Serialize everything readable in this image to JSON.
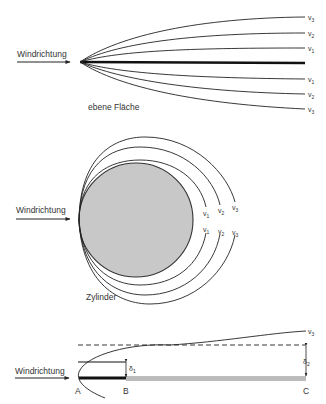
{
  "colors": {
    "line": "#222222",
    "plate": "#111111",
    "cylinder_fill": "#c8c8c8",
    "cylinder_stroke": "#333333",
    "text": "#333333",
    "plate_gray": "#999999"
  },
  "panel1": {
    "title": "ebene Fläche",
    "wind_label": "Windrichtung",
    "velocity_labels_upper": [
      {
        "base": "v",
        "sub": "3"
      },
      {
        "base": "v",
        "sub": "2"
      },
      {
        "base": "v",
        "sub": "1"
      }
    ],
    "velocity_labels_lower": [
      {
        "base": "v",
        "sub": "1"
      },
      {
        "base": "v",
        "sub": "2"
      },
      {
        "base": "v",
        "sub": "3"
      }
    ]
  },
  "panel2": {
    "title": "Zylinder",
    "wind_label": "Windrichtung",
    "velocity_labels_upper": [
      {
        "base": "v",
        "sub": "1"
      },
      {
        "base": "v",
        "sub": "2"
      },
      {
        "base": "v",
        "sub": "3"
      }
    ],
    "velocity_labels_lower": [
      {
        "base": "v",
        "sub": "1"
      },
      {
        "base": "v",
        "sub": "2"
      },
      {
        "base": "v",
        "sub": "3"
      }
    ]
  },
  "panel3": {
    "wind_label": "Windrichtung",
    "velocity_label": {
      "base": "v",
      "sub": "3"
    },
    "delta1": {
      "base": "δ",
      "sub": "1"
    },
    "delta2": {
      "base": "δ",
      "sub": "2"
    },
    "points": [
      "A",
      "B",
      "C"
    ]
  }
}
